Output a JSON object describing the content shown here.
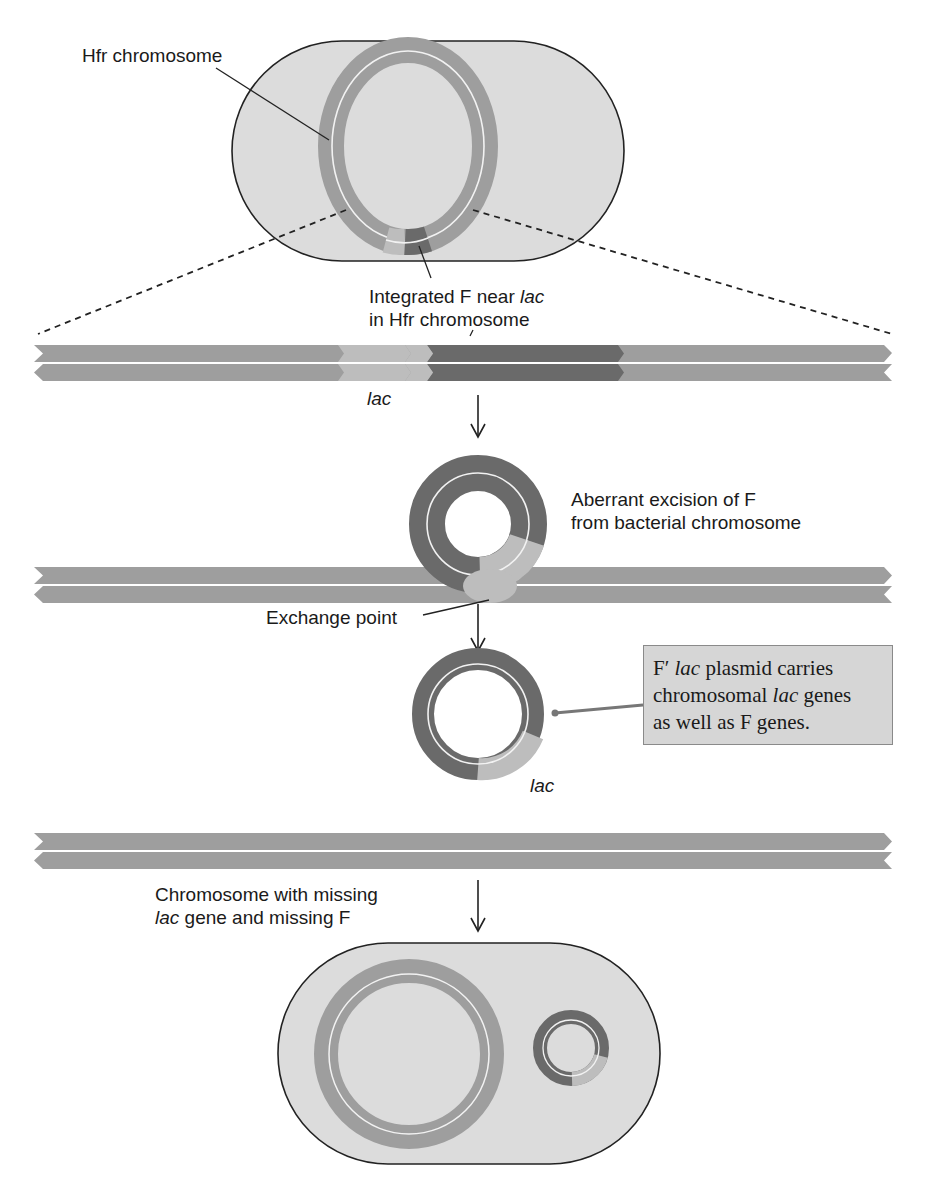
{
  "figure": {
    "colors": {
      "cell_fill": "#dcdcdc",
      "cell_outline": "#222222",
      "chromosome": "#9e9e9e",
      "lac_region": "#bdbdbd",
      "f_factor": "#6a6a6a",
      "callout_fill": "#d6d6d6",
      "callout_border": "#8a8a8a",
      "text": "#1a1a1a"
    }
  },
  "labels": {
    "hfr_chromosome": "Hfr chromosome",
    "integrated_f_line1_pre": "Integrated F near ",
    "integrated_f_line1_italic": "lac",
    "integrated_f_line2": "in Hfr chromosome",
    "lac_top": "lac",
    "aberrant_line1": "Aberrant excision of F",
    "aberrant_line2": "from bacterial chromosome",
    "exchange_point": "Exchange point",
    "lac_plasmid": "lac",
    "missing_line1": "Chromosome with missing",
    "missing_line2_italic": "lac",
    "missing_line2_rest": " gene and missing F"
  },
  "callout": {
    "line1_pre": "F′ ",
    "line1_italic": "lac",
    "line1_post": " plasmid carries",
    "line2_pre": "chromosomal ",
    "line2_italic": "lac",
    "line2_post": " genes",
    "line3": "as well as F genes."
  },
  "steps": [
    {
      "name": "hfr-cell",
      "description": "Hfr cell with F integrated near lac"
    },
    {
      "name": "linear-hfr-region",
      "description": "Expanded linear view: chromosome, lac, integrated F"
    },
    {
      "name": "aberrant-excision",
      "description": "F loops out carrying lac"
    },
    {
      "name": "f-prime-plasmid",
      "description": "Free F' lac plasmid and chromosome missing lac and F"
    },
    {
      "name": "f-prime-cell",
      "description": "Cell containing chromosome and F' lac plasmid"
    }
  ]
}
